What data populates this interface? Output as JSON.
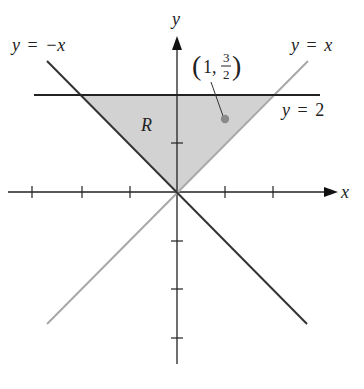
{
  "figure": {
    "type": "region-in-plane",
    "region_label": "R",
    "axes": {
      "x_label": "x",
      "y_label": "y",
      "unit_px": 48.3,
      "origin_px": [
        177,
        192
      ],
      "x_ticks": [
        -3,
        -2,
        -1,
        1,
        2
      ],
      "y_ticks": [
        1,
        -1,
        -2,
        -3
      ]
    },
    "curves": [
      {
        "name": "y = -x",
        "label_lhs": "y",
        "label_eq": "=",
        "label_rhs": "−x",
        "color": "#333333"
      },
      {
        "name": "y = x",
        "label_lhs": "y",
        "label_eq": "=",
        "label_rhs": "x",
        "color": "#aaaaaa"
      },
      {
        "name": "y = 2",
        "label_lhs": "y",
        "label_eq": "=",
        "label_rhs": "2",
        "color": "#222222"
      }
    ],
    "point": {
      "x": 1,
      "y": 1.5,
      "label_open": "(",
      "label_x": "1,",
      "label_num": "3",
      "label_den": "2",
      "label_close": ")",
      "color": "#8a8a8a"
    },
    "region_fill": "#d2d2d2"
  }
}
